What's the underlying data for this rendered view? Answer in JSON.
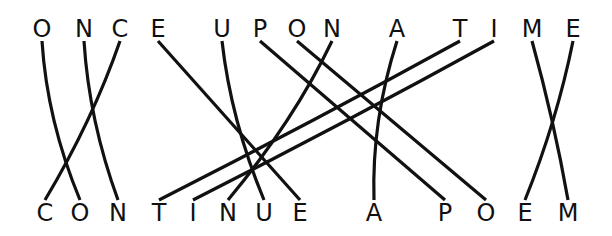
{
  "top_phrase": "ONCE UPON A TIME",
  "bottom_phrase": "CONTINUE A POEM",
  "colors": {
    "ink": "#111111",
    "background": "#ffffff"
  },
  "top_letters": [
    "O",
    "N",
    "C",
    "E",
    "U",
    "P",
    "O",
    "N",
    "A",
    "T",
    "I",
    "M",
    "E"
  ],
  "bottom_letters": [
    "C",
    "O",
    "N",
    "T",
    "I",
    "N",
    "U",
    "E",
    "A",
    "P",
    "O",
    "E",
    "M"
  ],
  "connections": [
    {
      "from": 0,
      "to": 1,
      "letter": "O"
    },
    {
      "from": 1,
      "to": 2,
      "letter": "N"
    },
    {
      "from": 2,
      "to": 0,
      "letter": "C"
    },
    {
      "from": 3,
      "to": 7,
      "letter": "E"
    },
    {
      "from": 4,
      "to": 6,
      "letter": "U"
    },
    {
      "from": 5,
      "to": 9,
      "letter": "P"
    },
    {
      "from": 6,
      "to": 10,
      "letter": "O"
    },
    {
      "from": 7,
      "to": 5,
      "letter": "N"
    },
    {
      "from": 8,
      "to": 8,
      "letter": "A"
    },
    {
      "from": 9,
      "to": 3,
      "letter": "T"
    },
    {
      "from": 10,
      "to": 4,
      "letter": "I"
    },
    {
      "from": 11,
      "to": 12,
      "letter": "M"
    },
    {
      "from": 12,
      "to": 11,
      "letter": "E"
    }
  ]
}
